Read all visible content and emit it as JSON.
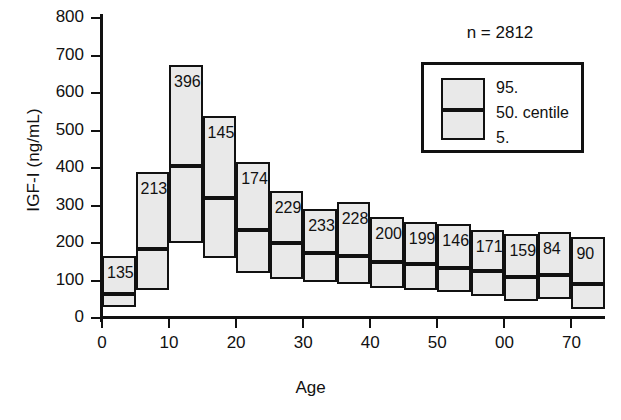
{
  "chart_data": {
    "type": "bar",
    "title": "",
    "xlabel": "Age",
    "ylabel": "IGF-I (ng/mL)",
    "xlim": [
      0,
      75
    ],
    "ylim": [
      0,
      800
    ],
    "grid": false,
    "annotation": "n = 2812",
    "legend_position": "top-right",
    "legend_entries": [
      "95.",
      "50. centile",
      "5."
    ],
    "xticks": [
      0,
      10,
      20,
      30,
      40,
      50,
      60,
      70
    ],
    "xtick_labels": [
      "0",
      "10",
      "20",
      "30",
      "40",
      "50",
      "00",
      "70"
    ],
    "yticks": [
      0,
      100,
      200,
      300,
      400,
      500,
      600,
      700,
      800
    ],
    "ytick_labels": [
      "0",
      "100",
      "200",
      "300",
      "400",
      "500",
      "600",
      "700",
      "800"
    ],
    "categories": [
      "0-5",
      "5-10",
      "10-15",
      "15-20",
      "20-25",
      "25-30",
      "30-35",
      "35-40",
      "40-45",
      "45-50",
      "50-55",
      "55-60",
      "60-65",
      "65-70",
      "70-75"
    ],
    "bars": [
      {
        "age_start": 0,
        "age_end": 5,
        "label": "135",
        "p5": 30,
        "p50": 70,
        "p95": 165
      },
      {
        "age_start": 5,
        "age_end": 10,
        "label": "213",
        "p5": 75,
        "p50": 190,
        "p95": 390
      },
      {
        "age_start": 10,
        "age_end": 15,
        "label": "396",
        "p5": 200,
        "p50": 410,
        "p95": 675
      },
      {
        "age_start": 15,
        "age_end": 20,
        "label": "145",
        "p5": 160,
        "p50": 325,
        "p95": 540
      },
      {
        "age_start": 20,
        "age_end": 25,
        "label": "174",
        "p5": 120,
        "p50": 240,
        "p95": 415
      },
      {
        "age_start": 25,
        "age_end": 30,
        "label": "229",
        "p5": 105,
        "p50": 205,
        "p95": 340
      },
      {
        "age_start": 30,
        "age_end": 35,
        "label": "233",
        "p5": 95,
        "p50": 180,
        "p95": 290
      },
      {
        "age_start": 35,
        "age_end": 40,
        "label": "228",
        "p5": 90,
        "p50": 170,
        "p95": 310
      },
      {
        "age_start": 40,
        "age_end": 45,
        "label": "200",
        "p5": 80,
        "p50": 155,
        "p95": 270
      },
      {
        "age_start": 45,
        "age_end": 50,
        "label": "199",
        "p5": 75,
        "p50": 150,
        "p95": 255
      },
      {
        "age_start": 50,
        "age_end": 55,
        "label": "146",
        "p5": 70,
        "p50": 140,
        "p95": 250
      },
      {
        "age_start": 55,
        "age_end": 60,
        "label": "171",
        "p5": 60,
        "p50": 130,
        "p95": 235
      },
      {
        "age_start": 60,
        "age_end": 65,
        "label": "159",
        "p5": 45,
        "p50": 115,
        "p95": 225
      },
      {
        "age_start": 65,
        "age_end": 70,
        "label": "84",
        "p5": 50,
        "p50": 120,
        "p95": 230
      },
      {
        "age_start": 70,
        "age_end": 75,
        "label": "90",
        "p5": 25,
        "p50": 95,
        "p95": 215
      }
    ],
    "series": [
      {
        "name": "5.",
        "values": [
          30,
          75,
          200,
          160,
          120,
          105,
          95,
          90,
          80,
          75,
          70,
          60,
          45,
          50,
          25
        ]
      },
      {
        "name": "50. centile",
        "values": [
          70,
          190,
          410,
          325,
          240,
          205,
          180,
          170,
          155,
          150,
          140,
          130,
          115,
          120,
          95
        ]
      },
      {
        "name": "95.",
        "values": [
          165,
          390,
          675,
          540,
          415,
          340,
          290,
          310,
          270,
          255,
          250,
          235,
          225,
          230,
          215
        ]
      },
      {
        "name": "n",
        "values": [
          135,
          213,
          396,
          145,
          174,
          229,
          233,
          228,
          200,
          199,
          146,
          171,
          159,
          84,
          90
        ]
      }
    ]
  },
  "colors": {
    "box_fill": "#e9e9e9",
    "line": "#111111",
    "background": "#ffffff"
  }
}
